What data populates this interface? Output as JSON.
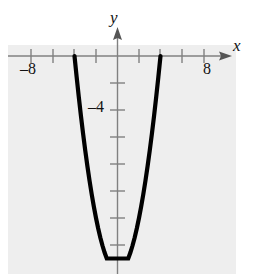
{
  "figure": {
    "background_color": "#ffffff",
    "plot_background_color": "#eeeeee",
    "curve_color": "#000000",
    "axis_color": "#808080"
  },
  "axes": {
    "x_axis_label": "x",
    "y_axis_label": "y",
    "x_tick_labels": [
      {
        "value": -8,
        "text": "–8"
      },
      {
        "value": 8,
        "text": "8"
      }
    ],
    "y_tick_labels": [
      {
        "value": -4,
        "text": "–4"
      }
    ]
  },
  "chart_data": {
    "type": "line",
    "title": "",
    "xlabel": "x",
    "ylabel": "y",
    "xlim": [
      -10,
      10
    ],
    "ylim": [
      -18,
      2
    ],
    "grid": false,
    "legend": "none",
    "x_ticks": [
      -8,
      -6,
      -4,
      -2,
      0,
      2,
      4,
      6,
      8
    ],
    "y_ticks": [
      -2,
      -4,
      -6,
      -8,
      -10,
      -12,
      -14,
      -16
    ],
    "annotations": [
      "–8",
      "8",
      "–4",
      "x",
      "y"
    ],
    "series": [
      {
        "name": "parabola",
        "equation": "y = x^2 - 16",
        "vertex": [
          0,
          -16
        ],
        "x_intercepts": [
          -4,
          4
        ],
        "y_intercept": -16,
        "x": [
          -4.6,
          -4.4,
          -4.2,
          -4.0,
          -3.8,
          -3.6,
          -3.4,
          -3.2,
          -3.0,
          -2.8,
          -2.6,
          -2.4,
          -2.2,
          -2.0,
          -1.8,
          -1.6,
          -1.4,
          -1.2,
          -1.0,
          -0.8,
          -0.6,
          -0.4,
          -0.2,
          0.0,
          0.2,
          0.4,
          0.6,
          0.8,
          1.0,
          1.2,
          1.4,
          1.6,
          1.8,
          2.0,
          2.2,
          2.4,
          2.6,
          2.8,
          3.0,
          3.2,
          3.4,
          3.6,
          3.8,
          4.0,
          4.2,
          4.4,
          4.6
        ],
        "values": [
          5.16,
          3.36,
          1.64,
          0.0,
          -1.56,
          -3.04,
          -4.44,
          -5.76,
          -7.0,
          -8.16,
          -9.24,
          -10.24,
          -11.16,
          -12.0,
          -12.76,
          -13.44,
          -14.04,
          -14.56,
          -15.0,
          -15.36,
          -15.64,
          -15.84,
          -15.96,
          -16.0,
          -15.96,
          -15.84,
          -15.64,
          -15.36,
          -15.0,
          -14.56,
          -14.04,
          -13.44,
          -12.76,
          -12.0,
          -11.16,
          -10.24,
          -9.24,
          -8.16,
          -7.0,
          -5.76,
          -4.44,
          -3.04,
          -1.56,
          0.0,
          1.64,
          3.36,
          5.16
        ]
      }
    ]
  }
}
